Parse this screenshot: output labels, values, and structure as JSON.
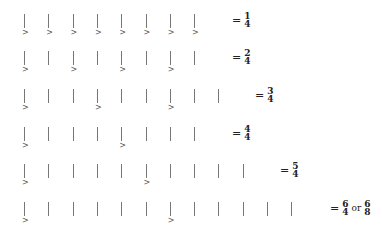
{
  "rows": [
    {
      "beats": 8,
      "accents": [
        0,
        1,
        2,
        3,
        4,
        5,
        6,
        7
      ],
      "equals": "=",
      "num": "1",
      "den": "4",
      "alt": null
    },
    {
      "beats": 8,
      "accents": [
        0,
        2,
        4,
        6
      ],
      "equals": "=",
      "num": "2",
      "den": "4",
      "alt": null
    },
    {
      "beats": 9,
      "accents": [
        0,
        3,
        6
      ],
      "equals": "=",
      "num": "3",
      "den": "4",
      "alt": null
    },
    {
      "beats": 8,
      "accents": [
        0,
        4
      ],
      "equals": "=",
      "num": "4",
      "den": "4",
      "alt": null
    },
    {
      "beats": 10,
      "accents": [
        0,
        5
      ],
      "equals": "=",
      "num": "5",
      "den": "4",
      "alt": null
    },
    {
      "beats": 12,
      "accents": [
        0,
        6
      ],
      "equals": "=",
      "num": "6",
      "den": "4",
      "alt": {
        "or": "or",
        "num": "6",
        "den": "8"
      }
    }
  ],
  "accent_symbol": ">",
  "colors": {
    "bar": "#777777",
    "text": "#222222"
  }
}
